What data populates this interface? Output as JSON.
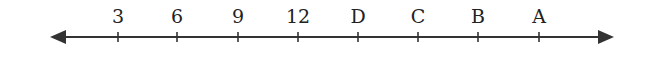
{
  "diagram": {
    "type": "number-line",
    "line_color": "#333333",
    "line_y": 37,
    "x_start": 50,
    "x_end": 614,
    "ticks": [
      {
        "label": "3",
        "x": 118
      },
      {
        "label": "6",
        "x": 177
      },
      {
        "label": "9",
        "x": 238
      },
      {
        "label": "12",
        "x": 298
      },
      {
        "label": "D",
        "x": 358
      },
      {
        "label": "C",
        "x": 418
      },
      {
        "label": "B",
        "x": 478
      },
      {
        "label": "A",
        "x": 539
      }
    ]
  }
}
